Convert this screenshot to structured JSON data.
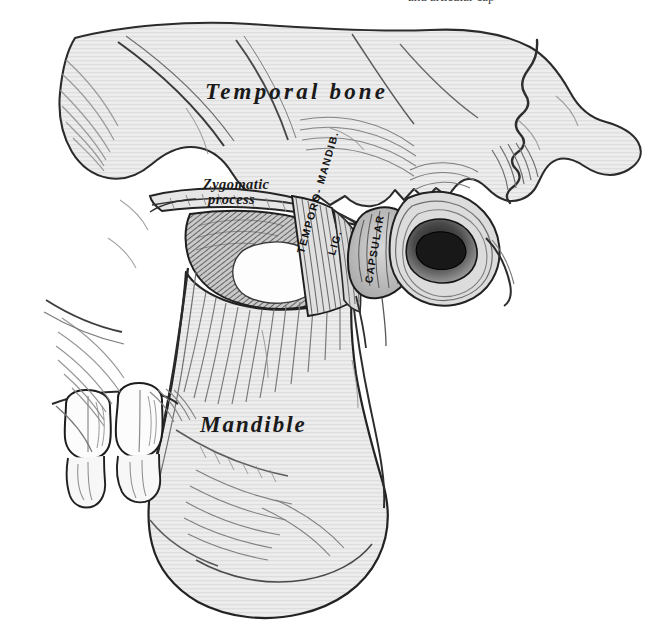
{
  "plate": {
    "title": "Articulation of the mandible with the temporal bone",
    "caption_clipped": "and articular cap",
    "background_color": "#ffffff",
    "ink_color": "#1a1a1a",
    "bone_fill": "#ebebeb"
  },
  "labels": {
    "temporal_bone": "Temporal bone",
    "mandible": "Mandible",
    "zygomatic_process_line1": "Zygomatic",
    "zygomatic_process_line2": "process"
  },
  "ligament_labels": {
    "temporo_mandibular": "TEMPORO- MANDIB.",
    "temporo_mandibular_abbr": "LIG.",
    "capsular": "CAPSULAR"
  },
  "structures": [
    {
      "name": "temporal-bone",
      "label": "Temporal bone"
    },
    {
      "name": "zygomatic-process",
      "label": "Zygomatic process"
    },
    {
      "name": "mandible",
      "label": "Mandible"
    },
    {
      "name": "mandibular-ramus",
      "label": "Ramus of mandible"
    },
    {
      "name": "mandibular-condyle",
      "label": "Condyle"
    },
    {
      "name": "coronoid-process",
      "label": "Coronoid process"
    },
    {
      "name": "external-auditory-meatus",
      "label": "External auditory meatus"
    },
    {
      "name": "mastoid-process",
      "label": "Mastoid process"
    },
    {
      "name": "temporomandibular-ligament",
      "label": "Temporomandibular ligament"
    },
    {
      "name": "capsular-ligament",
      "label": "Capsular ligament"
    },
    {
      "name": "molar-teeth",
      "label": "Molar teeth"
    },
    {
      "name": "mandibular-notch",
      "label": "Mandibular notch"
    },
    {
      "name": "angle-of-mandible",
      "label": "Angle of mandible"
    }
  ]
}
